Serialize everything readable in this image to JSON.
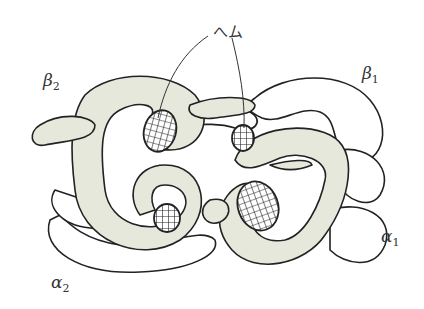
{
  "diagram": {
    "heme_label": "へム",
    "subunits": [
      {
        "id": "beta2",
        "symbol": "β",
        "subscript": "2",
        "shaded": true
      },
      {
        "id": "beta1",
        "symbol": "β",
        "subscript": "1",
        "shaded": false
      },
      {
        "id": "alpha1",
        "symbol": "α",
        "subscript": "1",
        "shaded": true
      },
      {
        "id": "alpha2",
        "symbol": "α",
        "subscript": "2",
        "shaded": false
      }
    ],
    "heme_count": 4,
    "colors": {
      "shaded_chain": "#e6e8dc",
      "outline": "#222222",
      "background": "#ffffff"
    }
  }
}
